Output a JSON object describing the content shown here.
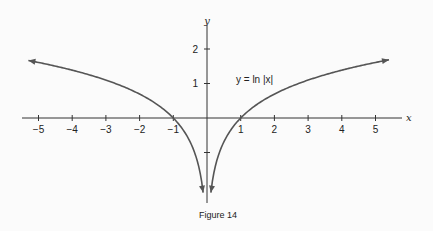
{
  "chart_data": {
    "type": "line",
    "title": "",
    "caption": "Figure 14",
    "function_label": "y = ln |x|",
    "xlabel": "x",
    "ylabel": "y",
    "xlim": [
      -5.3,
      5.5
    ],
    "ylim": [
      -2.5,
      2.5
    ],
    "grid": false,
    "legend": null,
    "x_ticks": [
      -5,
      -4,
      -3,
      -2,
      -1,
      1,
      2,
      3,
      4,
      5
    ],
    "x_tick_labels": [
      "−5",
      "−4",
      "−3",
      "−2",
      "−1",
      "1",
      "2",
      "3",
      "4",
      "5"
    ],
    "y_ticks": [
      2,
      1,
      -1
    ],
    "y_tick_labels": [
      "2",
      "1",
      ""
    ],
    "series": [
      {
        "name": "y = ln |x| (x < 0)",
        "x": [
          -5.3,
          -5,
          -4,
          -3,
          -2,
          -1,
          -0.5,
          -0.25,
          -0.12
        ],
        "y": [
          1.67,
          1.61,
          1.39,
          1.1,
          0.69,
          0.0,
          -0.69,
          -1.39,
          -2.0
        ]
      },
      {
        "name": "y = ln |x| (x > 0)",
        "x": [
          0.12,
          0.25,
          0.5,
          1,
          2,
          3,
          4,
          5,
          5.3
        ],
        "y": [
          -2.0,
          -1.39,
          -0.69,
          0.0,
          0.69,
          1.1,
          1.39,
          1.61,
          1.67
        ]
      }
    ],
    "annotations": [
      {
        "text": "y = ln |x|",
        "x": 1.7,
        "y": 1.1
      }
    ],
    "colors": {
      "curve": "#555555",
      "axes": "#333333",
      "background": "#fbfbfb"
    }
  }
}
